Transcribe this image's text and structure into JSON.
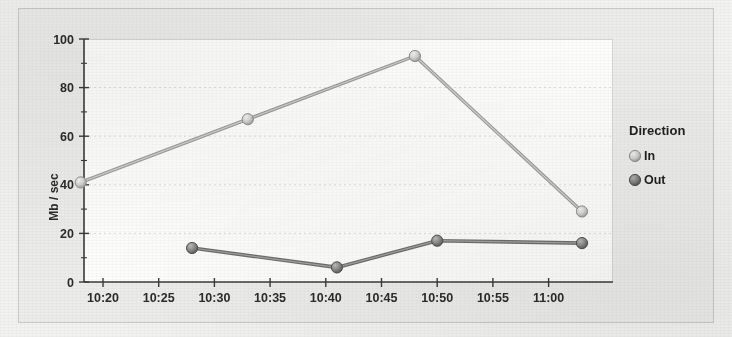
{
  "chart_data": {
    "type": "line",
    "title": "",
    "xlabel": "",
    "ylabel": "Mb / sec",
    "ylim": [
      0,
      100
    ],
    "yticks": [
      0,
      20,
      40,
      60,
      80,
      100
    ],
    "ytick_labels": [
      "0",
      "20",
      "40",
      "60",
      "80",
      "100"
    ],
    "yminor_ticks": [
      10,
      30,
      50,
      70,
      90
    ],
    "xtick_labels": [
      "10:20",
      "10:25",
      "10:30",
      "10:35",
      "10:40",
      "10:45",
      "10:50",
      "10:55",
      "11:00"
    ],
    "grid": true,
    "grid_axis": "y",
    "legend": {
      "title": "Direction",
      "position": "right",
      "entries": [
        {
          "label": "In",
          "marker": "circle",
          "color": "#cbcbcb"
        },
        {
          "label": "Out",
          "marker": "circle",
          "color": "#7a7a7a"
        }
      ]
    },
    "series": [
      {
        "name": "In",
        "color": "#b5b5b5",
        "points": [
          {
            "x": "10:18",
            "y": 41
          },
          {
            "x": "10:33",
            "y": 67
          },
          {
            "x": "10:48",
            "y": 93
          },
          {
            "x": "11:03",
            "y": 29
          }
        ]
      },
      {
        "name": "Out",
        "color": "#6d6d6d",
        "points": [
          {
            "x": "10:28",
            "y": 14
          },
          {
            "x": "10:41",
            "y": 6
          },
          {
            "x": "10:50",
            "y": 17
          },
          {
            "x": "11:03",
            "y": 16
          }
        ]
      }
    ]
  },
  "colors": {
    "page_background": "#f2f2f0",
    "panel_background": "#ececeb",
    "plot_background": "#fdfdfc",
    "axis": "#3a3a3a",
    "gridline": "#dcdcda",
    "series_in": "#b5b5b5",
    "series_out": "#6d6d6d"
  }
}
